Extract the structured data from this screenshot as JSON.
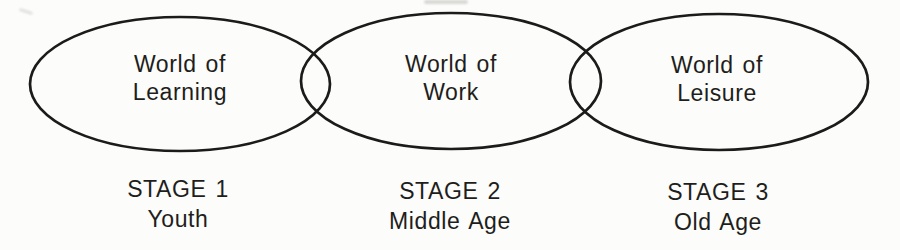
{
  "diagram": {
    "stages": [
      {
        "world": [
          "World of",
          "Learning"
        ],
        "stage": "STAGE 1",
        "age": "Youth"
      },
      {
        "world": [
          "World of",
          "Work"
        ],
        "stage": "STAGE 2",
        "age": "Middle Age"
      },
      {
        "world": [
          "World of",
          "Leisure"
        ],
        "stage": "STAGE 3",
        "age": "Old Age"
      }
    ]
  },
  "colors": {
    "ellipse_stroke": "#1b1b19",
    "text": "#1e1e1c",
    "background": "#fcfcfa"
  }
}
